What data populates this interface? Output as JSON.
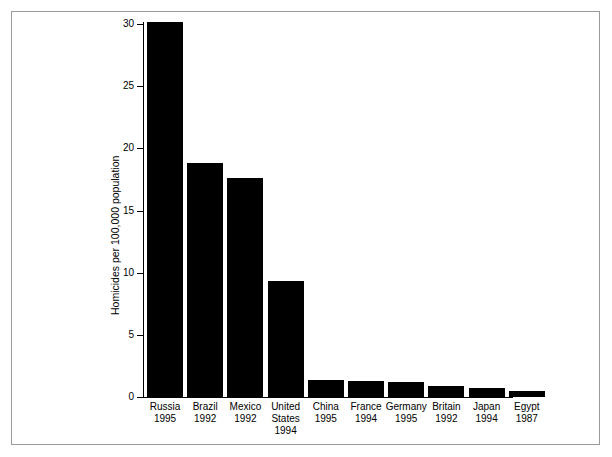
{
  "chart_data": {
    "type": "bar",
    "title": "",
    "xlabel": "",
    "ylabel": "Homicides per 100,000 population",
    "ylim": [
      0,
      30
    ],
    "yticks": [
      0,
      5,
      10,
      15,
      20,
      25,
      30
    ],
    "ytick_labels": [
      "0",
      "5",
      "10",
      "15",
      "20",
      "25",
      "30"
    ],
    "grid": false,
    "legend": false,
    "bar_color": "#000000",
    "background_color": "#ffffff",
    "categories": [
      "Russia 1995",
      "Brazil 1992",
      "Mexico 1992",
      "United States 1994",
      "China 1995",
      "France 1994",
      "Germany 1995",
      "Britain 1992",
      "Japan 1994",
      "Egypt 1987"
    ],
    "category_lines": [
      [
        "Russia",
        "1995"
      ],
      [
        "Brazil",
        "1992"
      ],
      [
        "Mexico",
        "1992"
      ],
      [
        "United",
        "States",
        "1994"
      ],
      [
        "China",
        "1995"
      ],
      [
        "France",
        "1994"
      ],
      [
        "Germany",
        "1995"
      ],
      [
        "Britain",
        "1992"
      ],
      [
        "Japan",
        "1994"
      ],
      [
        "Egypt",
        "1987"
      ]
    ],
    "values": [
      30.2,
      18.8,
      17.6,
      9.3,
      1.4,
      1.25,
      1.2,
      0.9,
      0.7,
      0.5
    ]
  },
  "figure": {
    "frame_color": "#9a9a9a"
  }
}
